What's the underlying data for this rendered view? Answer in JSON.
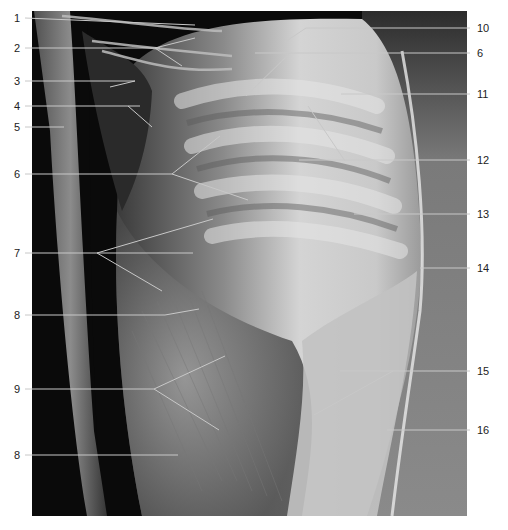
{
  "figure": {
    "colors": {
      "background": "#ffffff",
      "leader_line": "#c8c8c8",
      "label_text": "#222222"
    }
  },
  "labels_left": [
    {
      "id": "1",
      "text": "1",
      "y": 18,
      "line_end_x": 195,
      "line_end_y": 25
    },
    {
      "id": "2",
      "text": "2",
      "y": 48,
      "line_end_x": 160,
      "line_end_y": 48
    },
    {
      "id": "3",
      "text": "3",
      "y": 81,
      "line_end_x": 135,
      "line_end_y": 81
    },
    {
      "id": "4",
      "text": "4",
      "y": 106,
      "line_end_x": 140,
      "line_end_y": 106
    },
    {
      "id": "5",
      "text": "5",
      "y": 127,
      "line_end_x": 64,
      "line_end_y": 127
    },
    {
      "id": "6",
      "text": "6",
      "y": 174,
      "line_end_x": 172,
      "line_end_y": 174
    },
    {
      "id": "7",
      "text": "7",
      "y": 253,
      "line_end_x": 193,
      "line_end_y": 253
    },
    {
      "id": "8a",
      "text": "8",
      "y": 315,
      "line_end_x": 165,
      "line_end_y": 315
    },
    {
      "id": "9",
      "text": "9",
      "y": 389,
      "line_end_x": 154,
      "line_end_y": 389
    },
    {
      "id": "8b",
      "text": "8",
      "y": 455,
      "line_end_x": 178,
      "line_end_y": 455
    }
  ],
  "labels_right": [
    {
      "id": "10",
      "text": "10",
      "y": 28,
      "line_end_x": 306,
      "line_end_y": 28
    },
    {
      "id": "6r",
      "text": "6",
      "y": 53,
      "line_end_x": 255,
      "line_end_y": 53
    },
    {
      "id": "11",
      "text": "11",
      "y": 94,
      "line_end_x": 341,
      "line_end_y": 94
    },
    {
      "id": "12",
      "text": "12",
      "y": 160,
      "line_end_x": 299,
      "line_end_y": 160
    },
    {
      "id": "13",
      "text": "13",
      "y": 214,
      "line_end_x": 354,
      "line_end_y": 214
    },
    {
      "id": "14",
      "text": "14",
      "y": 268,
      "line_end_x": 420,
      "line_end_y": 268
    },
    {
      "id": "15",
      "text": "15",
      "y": 371,
      "line_end_x": 340,
      "line_end_y": 371
    },
    {
      "id": "16",
      "text": "16",
      "y": 430,
      "line_end_x": 387,
      "line_end_y": 430
    }
  ],
  "branch_lines": [
    {
      "from": [
        155,
        48
      ],
      "to": [
        195,
        38
      ]
    },
    {
      "from": [
        155,
        48
      ],
      "to": [
        182,
        66
      ]
    },
    {
      "from": [
        135,
        81
      ],
      "to": [
        110,
        87
      ]
    },
    {
      "from": [
        128,
        106
      ],
      "to": [
        152,
        127
      ]
    },
    {
      "from": [
        172,
        174
      ],
      "to": [
        220,
        136
      ]
    },
    {
      "from": [
        172,
        174
      ],
      "to": [
        248,
        200
      ]
    },
    {
      "from": [
        97,
        253
      ],
      "to": [
        213,
        219
      ]
    },
    {
      "from": [
        97,
        253
      ],
      "to": [
        162,
        291
      ]
    },
    {
      "from": [
        165,
        315
      ],
      "to": [
        199,
        309
      ]
    },
    {
      "from": [
        154,
        389
      ],
      "to": [
        225,
        356
      ]
    },
    {
      "from": [
        154,
        389
      ],
      "to": [
        219,
        430
      ]
    },
    {
      "from": [
        306,
        28
      ],
      "to": [
        285,
        42
      ]
    },
    {
      "from": [
        290,
        53
      ],
      "to": [
        246,
        96
      ]
    },
    {
      "from": [
        308,
        106
      ],
      "to": [
        345,
        161
      ]
    },
    {
      "from": [
        393,
        371
      ],
      "to": [
        314,
        415
      ]
    }
  ]
}
